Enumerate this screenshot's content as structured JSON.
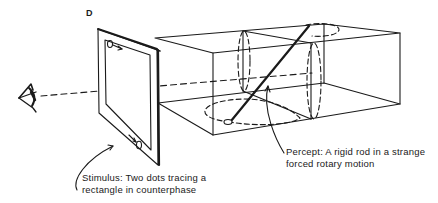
{
  "figure": {
    "panel_label": "D",
    "stimulus_caption": {
      "line1": "Stimulus: Two dots tracing a",
      "line2": "rectangle in counterphase"
    },
    "percept_caption": {
      "line1": "Percept: A rigid rod in a strange",
      "line2": "forced rotary motion"
    },
    "icons": {
      "eye": "eye-icon",
      "stimulus_screen": "screen-panel",
      "box": "perspective-box",
      "rod": "rigid-rod"
    },
    "colors": {
      "ink": "#1a1a1a",
      "background": "#ffffff"
    }
  }
}
